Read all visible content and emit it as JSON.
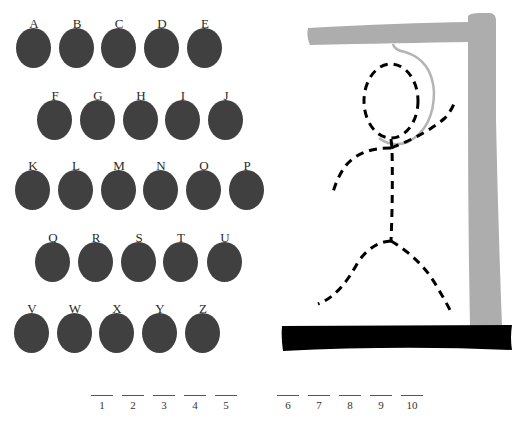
{
  "keyboard": {
    "rows": [
      {
        "letters": [
          "A",
          "B",
          "C",
          "D",
          "E"
        ],
        "x": [
          16,
          59,
          101,
          144,
          187
        ],
        "y": 17
      },
      {
        "letters": [
          "F",
          "G",
          "H",
          "I",
          "J"
        ],
        "x": [
          37,
          80,
          123,
          165,
          208
        ],
        "y": 89
      },
      {
        "letters": [
          "K",
          "L",
          "M",
          "N",
          "O",
          "P"
        ],
        "x": [
          15,
          58,
          101,
          143,
          186,
          229
        ],
        "y": 159
      },
      {
        "letters": [
          "Q",
          "R",
          "S",
          "T",
          "U"
        ],
        "x": [
          35,
          78,
          121,
          163,
          207
        ],
        "y": 231
      },
      {
        "letters": [
          "V",
          "W",
          "X",
          "Y",
          "Z"
        ],
        "x": [
          14,
          57,
          99,
          142,
          185
        ],
        "y": 302
      }
    ],
    "disc_color": "#404040"
  },
  "word_slots": [
    {
      "number": "1",
      "x": 91
    },
    {
      "number": "2",
      "x": 122
    },
    {
      "number": "3",
      "x": 153
    },
    {
      "number": "4",
      "x": 184
    },
    {
      "number": "5",
      "x": 215
    },
    {
      "number": "6",
      "x": 277
    },
    {
      "number": "7",
      "x": 308
    },
    {
      "number": "8",
      "x": 339
    },
    {
      "number": "9",
      "x": 370
    },
    {
      "number": "10",
      "x": 401
    }
  ],
  "gallows": {
    "beam_color": "#adadad",
    "base_color": "#000000",
    "rope_color": "#b4b4b4",
    "figure_color": "#000000",
    "figure_parts": [
      "head",
      "body",
      "left-arm",
      "right-arm",
      "left-leg",
      "right-leg"
    ]
  }
}
